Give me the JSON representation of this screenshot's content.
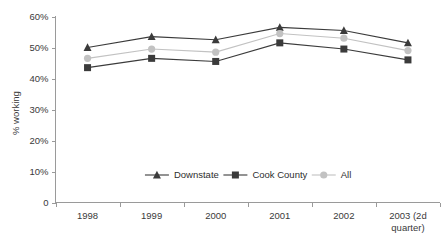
{
  "chart_data": {
    "type": "line",
    "title": "",
    "xlabel": "",
    "ylabel": "% working",
    "ylim": [
      0,
      60
    ],
    "grid": false,
    "legend_position": "inside-bottom-center",
    "categories": [
      "1998",
      "1999",
      "2000",
      "2001",
      "2002",
      "2003 (2d quarter)"
    ],
    "ytick_labels": [
      "60%",
      "50%",
      "40%",
      "30%",
      "20%",
      "10%",
      "0"
    ],
    "ytick_values": [
      60,
      50,
      40,
      30,
      20,
      10,
      0
    ],
    "series": [
      {
        "name": "Downstate",
        "marker": "triangle",
        "color": "#3b3b3b",
        "values": [
          50.0,
          53.5,
          52.5,
          56.5,
          55.5,
          51.5
        ]
      },
      {
        "name": "Cook County",
        "marker": "square",
        "color": "#3b3b3b",
        "values": [
          43.5,
          46.5,
          45.5,
          51.5,
          49.5,
          46.0
        ]
      },
      {
        "name": "All",
        "marker": "circle",
        "color": "#c2c2c2",
        "values": [
          46.5,
          49.5,
          48.5,
          54.5,
          53.0,
          49.0
        ]
      }
    ]
  },
  "legend": {
    "items": [
      {
        "label": "Downstate",
        "marker": "triangle",
        "color": "#3b3b3b"
      },
      {
        "label": "Cook County",
        "marker": "square",
        "color": "#3b3b3b"
      },
      {
        "label": "All",
        "marker": "circle",
        "color": "#c2c2c2"
      }
    ]
  },
  "axes": {
    "y_title": "% working",
    "x_tick_line1": [
      "1998",
      "1999",
      "2000",
      "2001",
      "2002",
      "2003 (2d"
    ],
    "x_tick_line2": [
      "",
      "",
      "",
      "",
      "",
      "quarter)"
    ]
  },
  "colors": {
    "axis": "#9a9a9a",
    "text": "#3a3a3a",
    "dark_series": "#3b3b3b",
    "light_series": "#c2c2c2",
    "background": "#ffffff"
  }
}
